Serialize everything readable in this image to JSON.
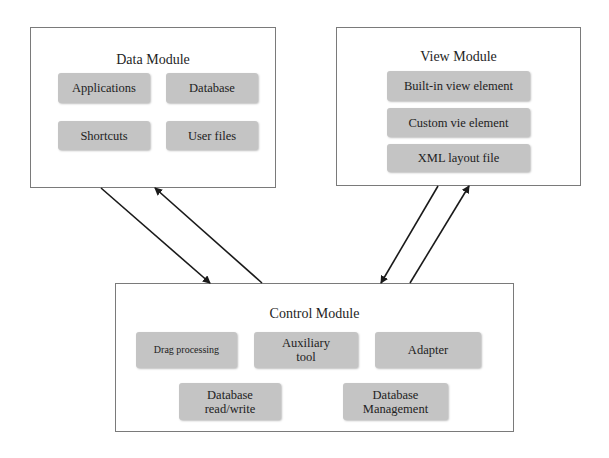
{
  "data_module": {
    "title": "Data Module",
    "items": [
      "Applications",
      "Database",
      "Shortcuts",
      "User files"
    ]
  },
  "view_module": {
    "title": "View Module",
    "items": [
      "Built-in view element",
      "Custom vie element",
      "XML layout file"
    ]
  },
  "control_module": {
    "title": "Control Module",
    "items": [
      "Drag processing",
      "Auxiliary tool",
      "Adapter",
      "Database read/write",
      "Database Management"
    ]
  },
  "arrows": [
    {
      "from": "Data Module",
      "to": "Control Module"
    },
    {
      "from": "Control Module",
      "to": "Data Module"
    },
    {
      "from": "View Module",
      "to": "Control Module"
    },
    {
      "from": "Control Module",
      "to": "View Module"
    }
  ],
  "colors": {
    "node_fill": "#c4c4c4",
    "border": "#7a7a7a",
    "arrow": "#1a1a1a"
  }
}
